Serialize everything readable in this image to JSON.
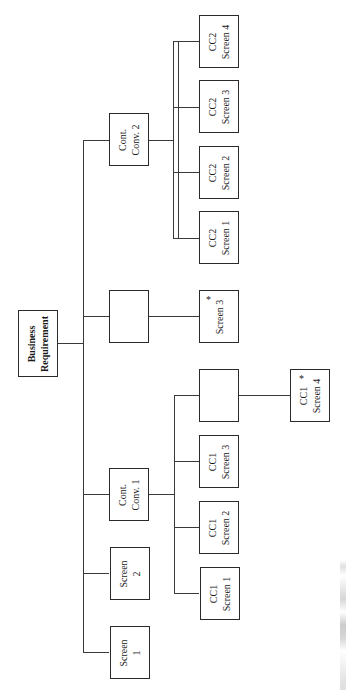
{
  "diagram": {
    "type": "hierarchy-chart",
    "orientation": "rotated-90",
    "root": {
      "label_line1": "Business",
      "label_line2": "Requirement"
    },
    "level1": [
      {
        "id": "cont-conv-2",
        "line1": "Cont.",
        "line2": "Conv. 2"
      },
      {
        "id": "blank-1",
        "line1": "",
        "line2": ""
      },
      {
        "id": "cont-conv-1",
        "line1": "Cont.",
        "line2": "Conv. 1"
      },
      {
        "id": "screen-2",
        "line1": "Screen",
        "line2": "2"
      },
      {
        "id": "screen-1",
        "line1": "Screen",
        "line2": "1"
      }
    ],
    "level2": [
      {
        "id": "cc2-screen-4",
        "parent": "cont-conv-2",
        "line1": "CC2",
        "line2": "Screen 4",
        "marked": false
      },
      {
        "id": "cc2-screen-3",
        "parent": "cont-conv-2",
        "line1": "CC2",
        "line2": "Screen 3",
        "marked": false
      },
      {
        "id": "cc2-screen-2",
        "parent": "cont-conv-2",
        "line1": "CC2",
        "line2": "Screen 2",
        "marked": false
      },
      {
        "id": "cc2-screen-1",
        "parent": "cont-conv-2",
        "line1": "CC2",
        "line2": "Screen 1",
        "marked": false
      },
      {
        "id": "screen-3",
        "parent": "blank-1",
        "line1": "",
        "line2": "Screen 3",
        "marked": true
      },
      {
        "id": "blank-2",
        "parent": "cont-conv-1",
        "line1": "",
        "line2": "",
        "marked": false
      },
      {
        "id": "cc1-screen-3",
        "parent": "cont-conv-1",
        "line1": "CC1",
        "line2": "Screen 3",
        "marked": false
      },
      {
        "id": "cc1-screen-2",
        "parent": "cont-conv-1",
        "line1": "CC1",
        "line2": "Screen 2",
        "marked": false
      },
      {
        "id": "cc1-screen-1",
        "parent": "cont-conv-1",
        "line1": "CC1",
        "line2": "Screen 1",
        "marked": false
      }
    ],
    "level3": [
      {
        "id": "cc1-screen-4",
        "parent": "blank-2",
        "line1": "CC1",
        "line2": "Screen 4",
        "marked": true
      }
    ],
    "marker_symbol": "*",
    "colors": {
      "line": "#3a3a3a",
      "box_border": "#2a2a2a",
      "background": "#ffffff"
    }
  }
}
